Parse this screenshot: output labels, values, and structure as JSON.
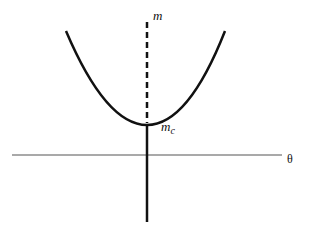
{
  "diagram": {
    "labels": {
      "vertical_axis": "m",
      "critical_point_base": "m",
      "critical_point_sub": "c",
      "horizontal_axis": "θ"
    },
    "colors": {
      "stroke": "#111111",
      "axis": "#555555",
      "background": "#ffffff"
    }
  }
}
